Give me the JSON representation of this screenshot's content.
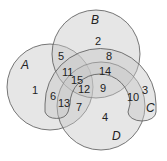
{
  "diagram": {
    "type": "venn-4-set",
    "sets": [
      {
        "name": "A",
        "shape": "circle"
      },
      {
        "name": "B",
        "shape": "circle"
      },
      {
        "name": "C",
        "shape": "horseshoe"
      },
      {
        "name": "D",
        "shape": "circle"
      }
    ],
    "set_labels": {
      "A": "A",
      "B": "B",
      "C": "C",
      "D": "D"
    },
    "regions": [
      {
        "label": "1",
        "sets": [
          "A"
        ]
      },
      {
        "label": "2",
        "sets": [
          "B"
        ]
      },
      {
        "label": "3",
        "sets": [
          "C"
        ]
      },
      {
        "label": "4",
        "sets": [
          "D"
        ]
      },
      {
        "label": "5",
        "sets": [
          "A",
          "B"
        ]
      },
      {
        "label": "6",
        "sets": [
          "A",
          "C"
        ]
      },
      {
        "label": "7",
        "sets": [
          "A",
          "D"
        ]
      },
      {
        "label": "8",
        "sets": [
          "B",
          "C"
        ]
      },
      {
        "label": "9",
        "sets": [
          "B",
          "D"
        ]
      },
      {
        "label": "10",
        "sets": [
          "C",
          "D"
        ]
      },
      {
        "label": "11",
        "sets": [
          "A",
          "B",
          "C"
        ]
      },
      {
        "label": "12",
        "sets": [
          "A",
          "B",
          "D"
        ]
      },
      {
        "label": "13",
        "sets": [
          "A",
          "C",
          "D"
        ]
      },
      {
        "label": "14",
        "sets": [
          "B",
          "C",
          "D"
        ]
      },
      {
        "label": "15",
        "sets": [
          "A",
          "B",
          "C",
          "D"
        ]
      }
    ],
    "colors": {
      "fill": "#d9d9d9",
      "stroke": "#555555",
      "background": "#ffffff"
    }
  }
}
